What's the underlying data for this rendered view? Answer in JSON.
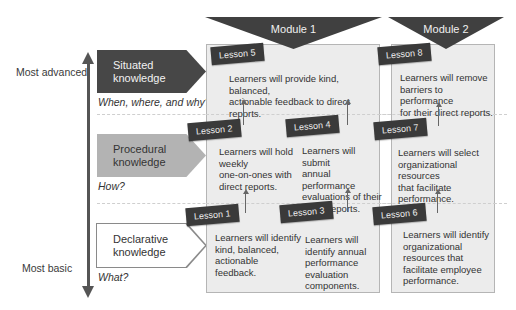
{
  "axis": {
    "top_label": "Most advanced",
    "bottom_label": "Most basic"
  },
  "knowledge_levels": [
    {
      "label_line1": "Situated",
      "label_line2": "knowledge",
      "question": "When, where, and why?",
      "fill": "#474747"
    },
    {
      "label_line1": "Procedural",
      "label_line2": "knowledge",
      "question": "How?",
      "fill": "#b3b3b3"
    },
    {
      "label_line1": "Declarative",
      "label_line2": "knowledge",
      "question": "What?",
      "fill": "#ffffff"
    }
  ],
  "modules": [
    {
      "title": "Module 1"
    },
    {
      "title": "Module 2"
    }
  ],
  "lessons": {
    "l1": {
      "label": "Lesson 1",
      "objective": [
        "Learners will identify",
        "kind, balanced,",
        "actionable",
        "feedback."
      ]
    },
    "l2": {
      "label": "Lesson 2",
      "objective": [
        "Learners will hold",
        "weekly",
        "one-on-ones with",
        "direct reports."
      ]
    },
    "l3": {
      "label": "Lesson 3",
      "objective": [
        "Learners will",
        "identify annual",
        "performance",
        "evaluation",
        "components."
      ]
    },
    "l4": {
      "label": "Lesson 4",
      "objective": [
        "Learners will submit",
        "annual performance",
        "evaluations of their",
        "direct reports."
      ]
    },
    "l5": {
      "label": "Lesson 5",
      "objective": [
        "Learners will provide kind, balanced,",
        "actionable feedback to direct reports."
      ]
    },
    "l6": {
      "label": "Lesson 6",
      "objective": [
        "Learners will identify",
        "organizational",
        "resources that",
        "facilitate employee",
        "performance."
      ]
    },
    "l7": {
      "label": "Lesson 7",
      "objective": [
        "Learners will select",
        "organizational resources",
        "that facilitate",
        "performance."
      ]
    },
    "l8": {
      "label": "Lesson 8",
      "objective": [
        "Learners will remove",
        "barriers to performance",
        "for their direct reports."
      ]
    }
  }
}
